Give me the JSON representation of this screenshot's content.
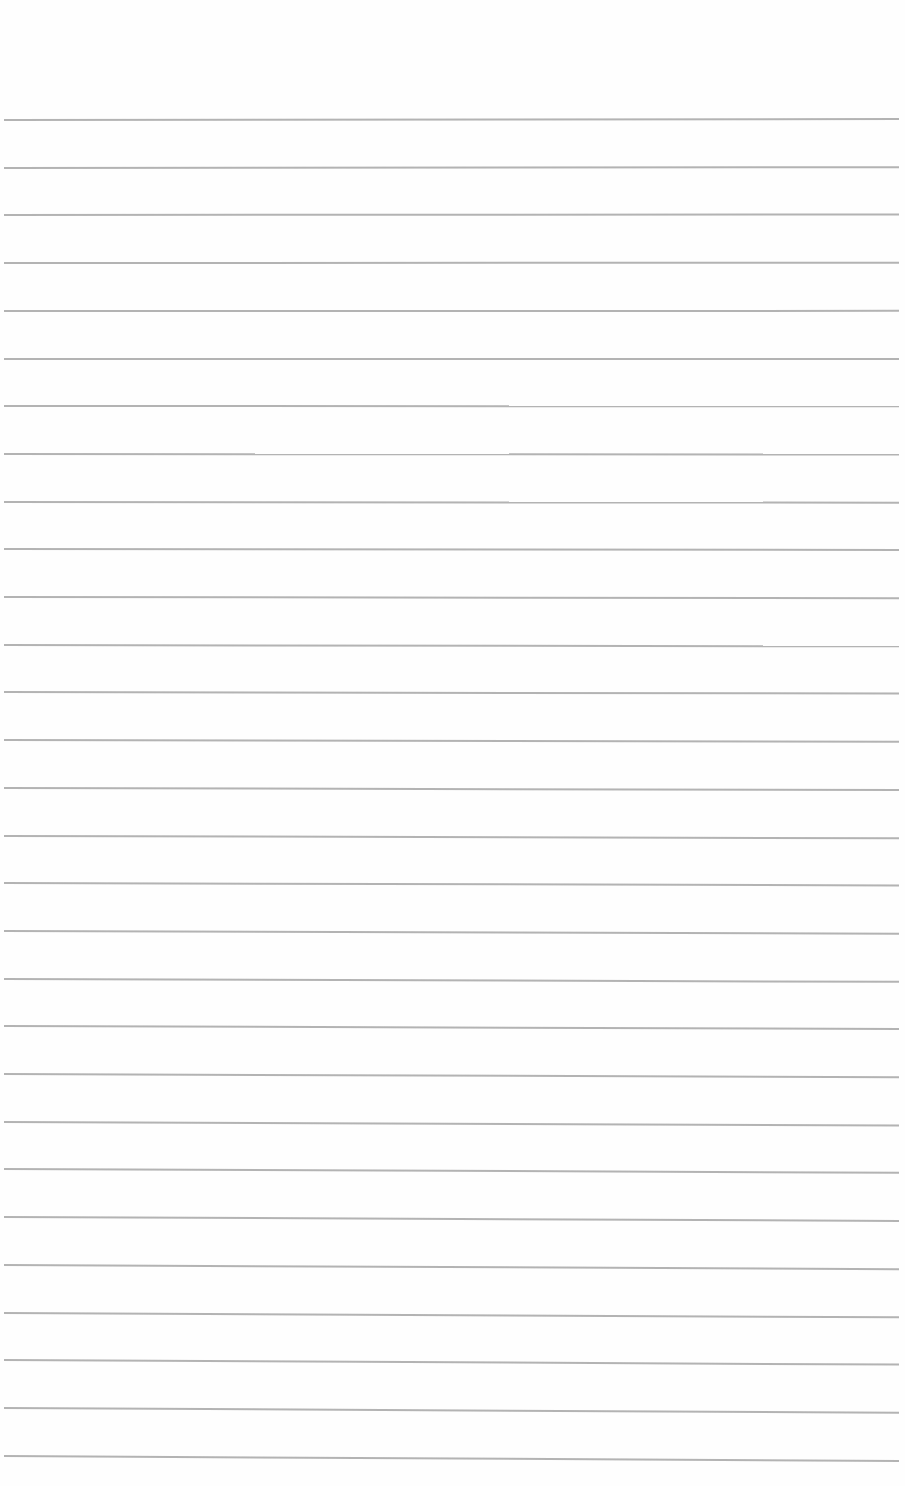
{
  "page": {
    "type": "lined-paper",
    "background_color": "#ffffff",
    "line_color": "#a6a6a6"
  },
  "rules": {
    "count": 29,
    "first_y": 119,
    "spacing": 47.7,
    "left_x": 4,
    "right_x": 899,
    "tilt_top_px": -1,
    "tilt_bottom_px": 5
  }
}
